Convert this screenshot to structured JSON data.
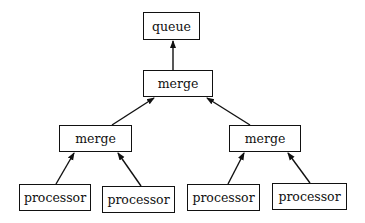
{
  "diagram": {
    "type": "tree",
    "nodes": [
      {
        "id": "queue",
        "label": "queue",
        "box": [
          143,
          12,
          57,
          28
        ]
      },
      {
        "id": "merge_top",
        "label": "merge",
        "box": [
          143,
          70,
          70,
          27
        ]
      },
      {
        "id": "merge_left",
        "label": "merge",
        "box": [
          59,
          125,
          73,
          27
        ]
      },
      {
        "id": "merge_right",
        "label": "merge",
        "box": [
          229,
          125,
          72,
          27
        ]
      },
      {
        "id": "proc1",
        "label": "processor",
        "box": [
          19,
          184,
          72,
          27
        ]
      },
      {
        "id": "proc2",
        "label": "processor",
        "box": [
          102,
          186,
          73,
          27
        ]
      },
      {
        "id": "proc3",
        "label": "processor",
        "box": [
          187,
          184,
          73,
          27
        ]
      },
      {
        "id": "proc4",
        "label": "processor",
        "box": [
          272,
          183,
          75,
          27
        ]
      }
    ],
    "edges": [
      {
        "from": "merge_top",
        "to": "queue"
      },
      {
        "from": "merge_left",
        "to": "merge_top"
      },
      {
        "from": "merge_right",
        "to": "merge_top"
      },
      {
        "from": "proc1",
        "to": "merge_left"
      },
      {
        "from": "proc2",
        "to": "merge_left"
      },
      {
        "from": "proc3",
        "to": "merge_right"
      },
      {
        "from": "proc4",
        "to": "merge_right"
      }
    ]
  }
}
